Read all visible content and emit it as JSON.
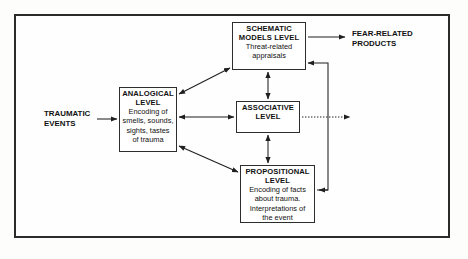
{
  "diagram": {
    "frame": {
      "border_color": "#2b2b2b",
      "background": "#fefefe"
    },
    "nodes": [
      {
        "id": "schematic",
        "heading": "SCHEMATIC",
        "heading2": "MODELS LEVEL",
        "detail": "Threat-related appraisals",
        "detail_lines": [
          "Threat-related",
          "appraisals"
        ]
      },
      {
        "id": "analogical",
        "heading": "ANALOGICAL",
        "heading2": "LEVEL",
        "detail": "Encoding of smells, sounds, sights, tastes of trauma",
        "detail_lines": [
          "Encoding of",
          "smells, sounds,",
          "sights, tastes",
          "of trauma"
        ]
      },
      {
        "id": "associative",
        "heading": "ASSOCIATIVE",
        "heading2": "LEVEL",
        "detail": "",
        "detail_lines": []
      },
      {
        "id": "propositional",
        "heading": "PROPOSITIONAL",
        "heading2": "LEVEL",
        "detail": "Encoding of facts about trauma. Interpretations of the event",
        "detail_lines": [
          "Encoding of facts",
          "about trauma.",
          "Interpretations of",
          "the event"
        ]
      }
    ],
    "labels": [
      {
        "id": "traumatic",
        "line1": "TRAUMATIC",
        "line2": "EVENTS"
      },
      {
        "id": "fear",
        "line1": "FEAR-RELATED",
        "line2": "PRODUCTS"
      }
    ],
    "connections": [
      {
        "id": "traumatic-to-analogical",
        "from": "traumatic-events",
        "to": "analogical",
        "style": "solid",
        "arrows": "single"
      },
      {
        "id": "analogical-to-schematic",
        "from": "analogical",
        "to": "schematic",
        "style": "solid",
        "arrows": "double"
      },
      {
        "id": "analogical-to-associative",
        "from": "analogical",
        "to": "associative",
        "style": "solid",
        "arrows": "double"
      },
      {
        "id": "analogical-to-propositional",
        "from": "analogical",
        "to": "propositional",
        "style": "solid",
        "arrows": "double"
      },
      {
        "id": "schematic-to-associative",
        "from": "schematic",
        "to": "associative",
        "style": "solid",
        "arrows": "double"
      },
      {
        "id": "associative-to-propositional",
        "from": "associative",
        "to": "propositional",
        "style": "solid",
        "arrows": "double"
      },
      {
        "id": "schematic-to-fear-products",
        "from": "schematic",
        "to": "fear-related-products",
        "style": "solid",
        "arrows": "single"
      },
      {
        "id": "associative-to-products",
        "from": "associative",
        "to": "products-output",
        "style": "dotted",
        "arrows": "single"
      },
      {
        "id": "feedback-loop-right",
        "from": "propositional",
        "to": "schematic",
        "style": "solid",
        "arrows": "single"
      }
    ],
    "colors": {
      "line": "#1f1f1f",
      "text": "#111111",
      "box_border": "#2d2d2d"
    }
  }
}
